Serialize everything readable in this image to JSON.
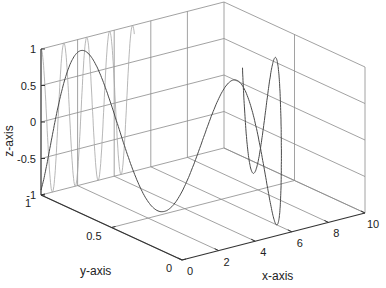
{
  "chart_data": {
    "type": "line",
    "subtype": "3d-line",
    "title": "",
    "xlabel": "x-axis",
    "ylabel": "y-axis",
    "zlabel": "z-axis",
    "xlim": [
      0,
      10
    ],
    "ylim": [
      0,
      1
    ],
    "zlim": [
      -1,
      1
    ],
    "xticks": [
      "0",
      "2",
      "4",
      "6",
      "8",
      "10"
    ],
    "yticks": [
      "0",
      "0.5",
      "1"
    ],
    "zticks": [
      "-1",
      "-0.5",
      "0",
      "0.5",
      "1"
    ],
    "grid": true,
    "series": [
      {
        "name": "back-wall projection (y=1)",
        "color": "#9a9a9a",
        "description": "z = sin(2*pi*x/1.9) drawn on y=1 plane from x=0 to x~5"
      },
      {
        "name": "main curve",
        "color": "#444444",
        "description": "3D sinusoid z = sin(x) traveling through the box"
      }
    ]
  },
  "axes": {
    "x_label": "x-axis",
    "y_label": "y-axis",
    "z_label": "z-axis"
  }
}
